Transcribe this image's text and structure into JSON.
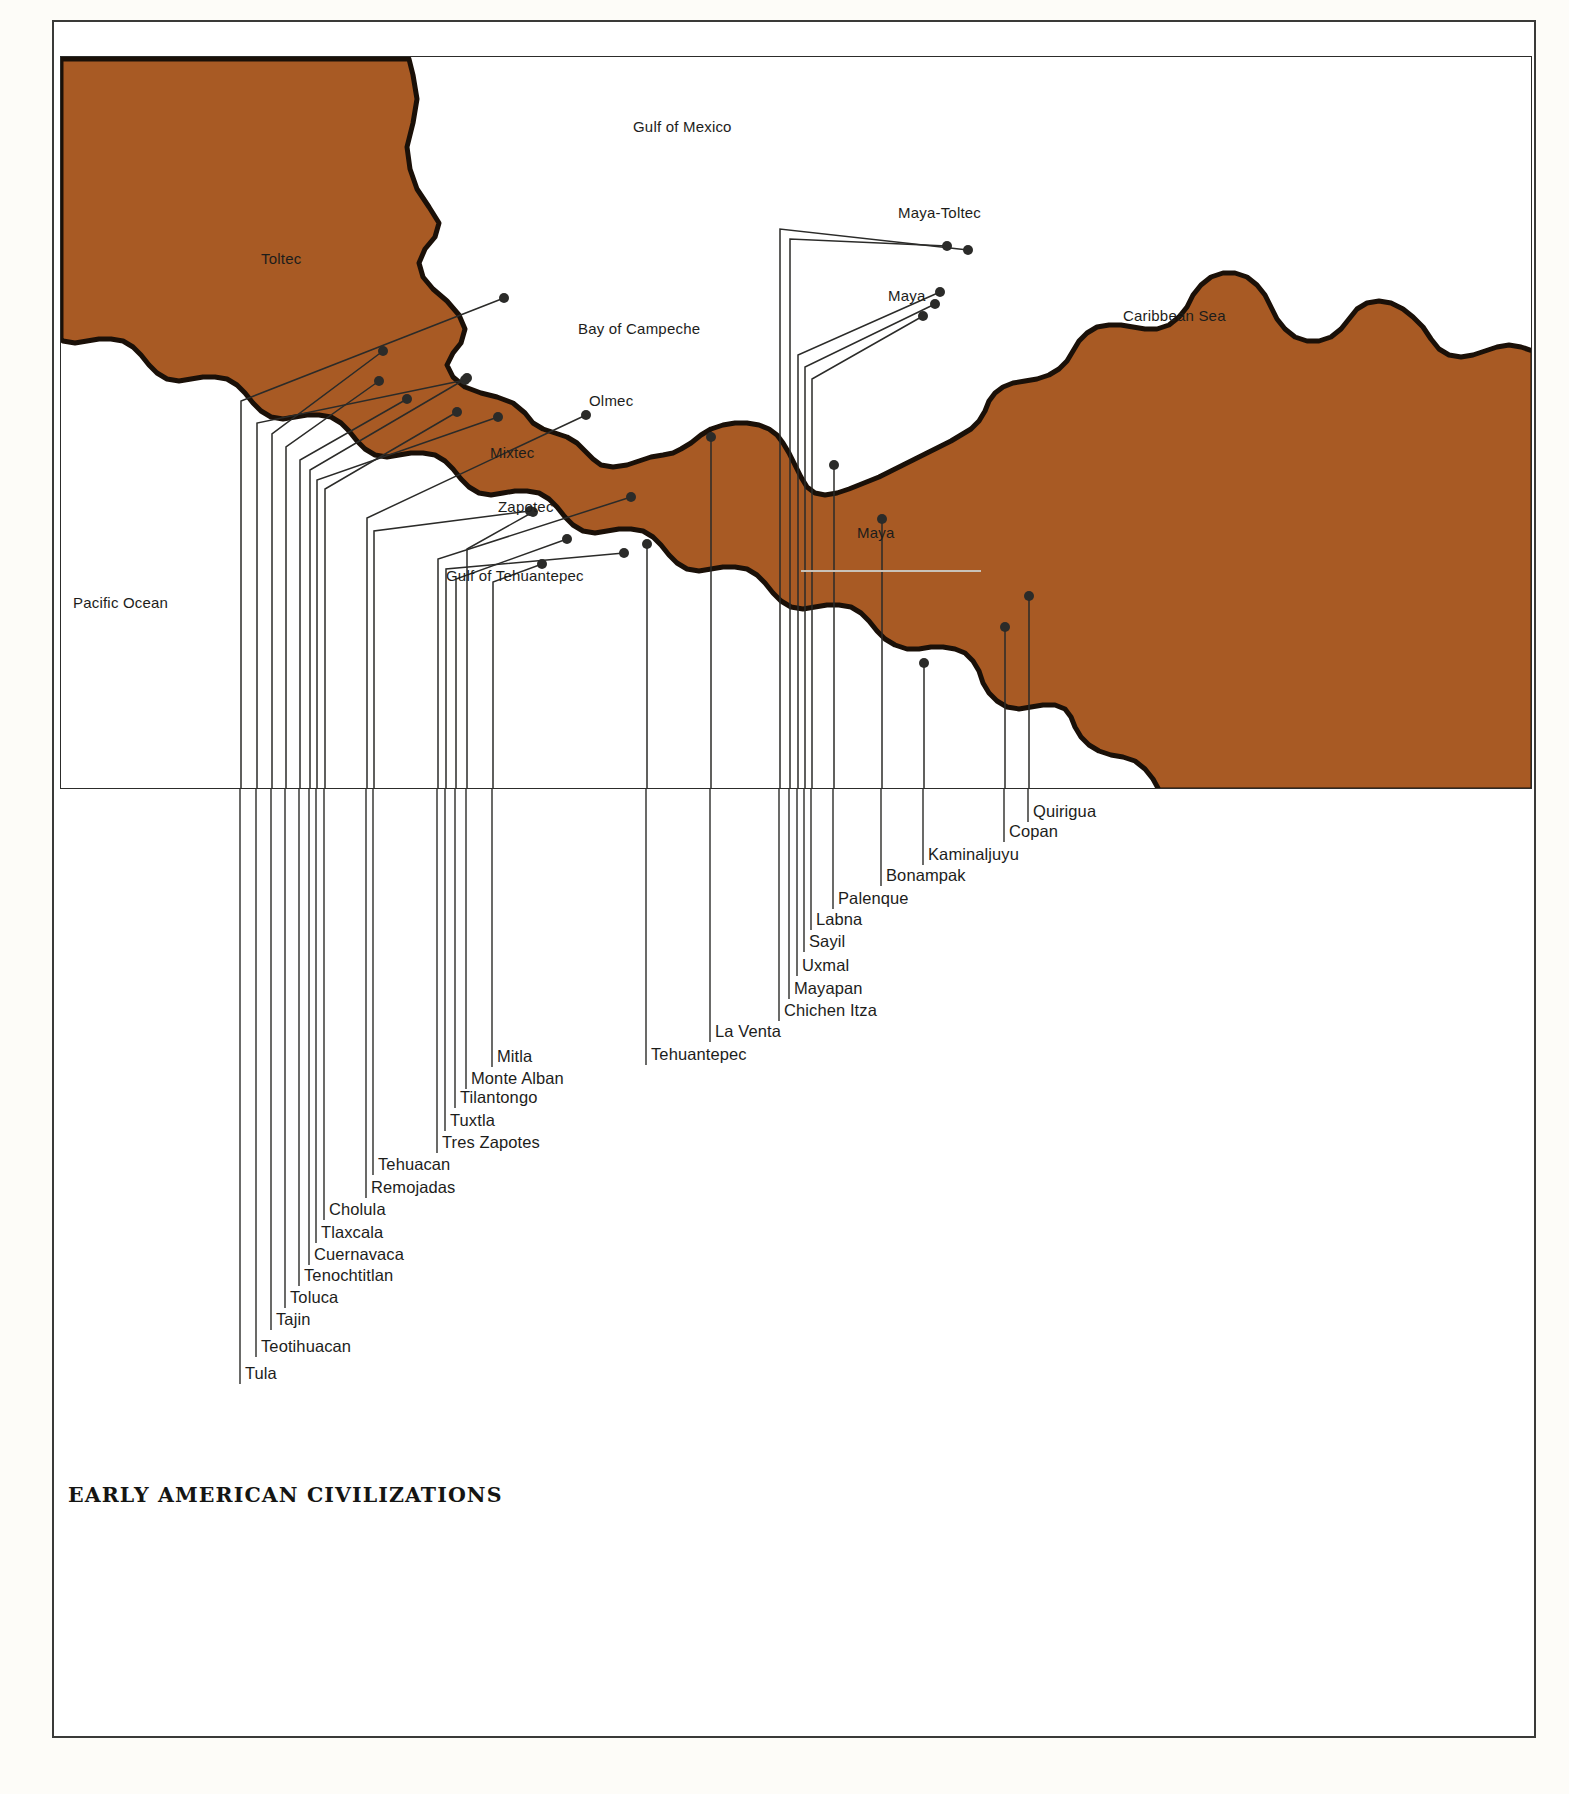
{
  "title": "EARLY AMERICAN CIVILIZATIONS",
  "colors": {
    "land": "#a85a24",
    "coastline": "#1a1008",
    "leader_line": "#2b2b29",
    "text": "#1d1d1b",
    "page_background": "#fdfcf8",
    "frame": "#2c2c2a"
  },
  "water_labels": [
    {
      "name": "Gulf of Mexico",
      "x": 633,
      "y": 118
    },
    {
      "name": "Bay of Campeche",
      "x": 578,
      "y": 320
    },
    {
      "name": "Caribbean Sea",
      "x": 1123,
      "y": 307
    },
    {
      "name": "Gulf of Tehuantepec",
      "x": 446,
      "y": 567
    },
    {
      "name": "Pacific Ocean",
      "x": 73,
      "y": 594
    }
  ],
  "culture_labels": [
    {
      "name": "Toltec",
      "x": 261,
      "y": 250
    },
    {
      "name": "Olmec",
      "x": 589,
      "y": 392
    },
    {
      "name": "Mixtec",
      "x": 490,
      "y": 444
    },
    {
      "name": "Zapotec",
      "x": 498,
      "y": 498
    },
    {
      "name": "Maya-Toltec",
      "x": 898,
      "y": 204
    },
    {
      "name": "Maya",
      "x": 888,
      "y": 287
    },
    {
      "name": "Maya",
      "x": 857,
      "y": 524
    }
  ],
  "sites": [
    {
      "name": "Tula",
      "dot_x": 443,
      "dot_y": 241,
      "line_x": 180,
      "label_y": 1372,
      "elbow_y": 344
    },
    {
      "name": "Teotihuacan",
      "dot_x": 404,
      "dot_y": 323,
      "line_x": 196,
      "label_y": 1345,
      "elbow_y": 366
    },
    {
      "name": "Tajin",
      "dot_x": 322,
      "dot_y": 294,
      "line_x": 211,
      "label_y": 1318,
      "elbow_y": 377
    },
    {
      "name": "Toluca",
      "dot_x": 318,
      "dot_y": 324,
      "line_x": 225,
      "label_y": 1296,
      "elbow_y": 390
    },
    {
      "name": "Tenochtitlan",
      "dot_x": 346,
      "dot_y": 342,
      "line_x": 239,
      "label_y": 1274,
      "elbow_y": 403
    },
    {
      "name": "Cuernavaca",
      "dot_x": 406,
      "dot_y": 321,
      "line_x": 249,
      "label_y": 1253,
      "elbow_y": 413
    },
    {
      "name": "Tlaxcala",
      "dot_x": 437,
      "dot_y": 360,
      "line_x": 256,
      "label_y": 1231,
      "elbow_y": 423
    },
    {
      "name": "Cholula",
      "dot_x": 396,
      "dot_y": 355,
      "line_x": 264,
      "label_y": 1208,
      "elbow_y": 432
    },
    {
      "name": "Remojadas",
      "dot_x": 525,
      "dot_y": 358,
      "line_x": 306,
      "label_y": 1186,
      "elbow_y": 461
    },
    {
      "name": "Tehuacan",
      "dot_x": 469,
      "dot_y": 454,
      "line_x": 313,
      "label_y": 1163,
      "elbow_y": 474
    },
    {
      "name": "Tres Zapotes",
      "dot_x": 570,
      "dot_y": 440,
      "line_x": 377,
      "label_y": 1141,
      "elbow_y": 502
    },
    {
      "name": "Tuxtla",
      "dot_x": 563,
      "dot_y": 496,
      "line_x": 385,
      "label_y": 1119,
      "elbow_y": 512
    },
    {
      "name": "Tilantongo",
      "dot_x": 506,
      "dot_y": 482,
      "line_x": 395,
      "label_y": 1096,
      "elbow_y": 522
    },
    {
      "name": "Monte Alban",
      "dot_x": 472,
      "dot_y": 455,
      "line_x": 406,
      "label_y": 1077,
      "elbow_y": 492
    },
    {
      "name": "Mitla",
      "dot_x": 481,
      "dot_y": 507,
      "line_x": 432,
      "label_y": 1055,
      "elbow_y": 525
    },
    {
      "name": "Tehuantepec",
      "dot_x": 586,
      "dot_y": 487,
      "line_x": 586,
      "label_y": 1053,
      "elbow_y": 0
    },
    {
      "name": "La Venta",
      "dot_x": 650,
      "dot_y": 380,
      "line_x": 650,
      "label_y": 1030,
      "elbow_y": 0
    },
    {
      "name": "Chichen Itza",
      "dot_x": 907,
      "dot_y": 193,
      "line_x": 719,
      "label_y": 1009,
      "elbow_y": 172
    },
    {
      "name": "Mayapan",
      "dot_x": 886,
      "dot_y": 189,
      "line_x": 729,
      "label_y": 987,
      "elbow_y": 182
    },
    {
      "name": "Uxmal",
      "dot_x": 879,
      "dot_y": 235,
      "line_x": 737,
      "label_y": 964,
      "elbow_y": 298
    },
    {
      "name": "Sayil",
      "dot_x": 874,
      "dot_y": 247,
      "line_x": 744,
      "label_y": 940,
      "elbow_y": 310
    },
    {
      "name": "Labna",
      "dot_x": 862,
      "dot_y": 259,
      "line_x": 751,
      "label_y": 918,
      "elbow_y": 322
    },
    {
      "name": "Palenque",
      "dot_x": 773,
      "dot_y": 408,
      "line_x": 773,
      "label_y": 897,
      "elbow_y": 0
    },
    {
      "name": "Bonampak",
      "dot_x": 821,
      "dot_y": 462,
      "line_x": 821,
      "label_y": 874,
      "elbow_y": 0
    },
    {
      "name": "Kaminaljuyu",
      "dot_x": 863,
      "dot_y": 606,
      "line_x": 863,
      "label_y": 853,
      "elbow_y": 0
    },
    {
      "name": "Copan",
      "dot_x": 944,
      "dot_y": 570,
      "line_x": 944,
      "label_y": 830,
      "elbow_y": 0
    },
    {
      "name": "Quirigua",
      "dot_x": 968,
      "dot_y": 539,
      "line_x": 968,
      "label_y": 810,
      "elbow_y": 0
    }
  ]
}
